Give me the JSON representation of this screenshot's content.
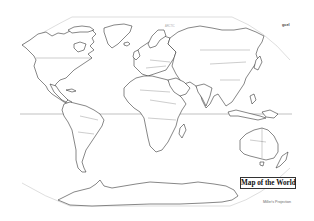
{
  "map": {
    "title": "Map of the World",
    "caption": "Miller's Projection",
    "corner_label": "gcel",
    "faint_label": "ARCTIC",
    "projection_style": "oval outline world map",
    "features": {
      "equator_line": true,
      "continents": [
        "North America",
        "South America",
        "Europe",
        "Africa",
        "Asia",
        "Australia",
        "Antarctica",
        "Greenland"
      ],
      "country_borders": true
    },
    "colors": {
      "background": "#ffffff",
      "land_fill": "#ffffff",
      "outline": "#222222",
      "frame": "#c8c8c8",
      "title_box_border": "#333333"
    }
  }
}
